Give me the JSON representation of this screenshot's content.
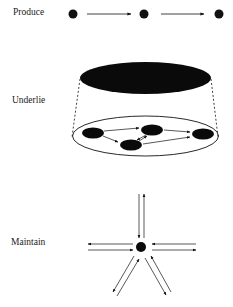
{
  "figure": {
    "panels": [
      {
        "id": "produce",
        "label": "Produce",
        "description": "Three nodes in a row connected by two forward arrows"
      },
      {
        "id": "underlie",
        "label": "Underlie",
        "description": "Large black ellipse projected (dashed lines) onto an outlined ellipse containing four connected nodes"
      },
      {
        "id": "maintain",
        "label": "Maintain",
        "description": "Central node with five pairs of bidirectional arrows radiating outward"
      }
    ],
    "colors": {
      "ink": "#111111",
      "background": "#ffffff"
    }
  }
}
